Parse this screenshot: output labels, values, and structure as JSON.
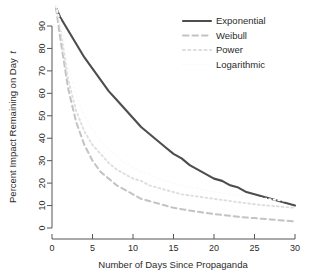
{
  "chart_data": {
    "type": "line",
    "title": "",
    "subtitle": "",
    "xlabel": "Number of Days Since Propaganda",
    "ylabel": "Percent Impact Remaining on Day t",
    "ylabel_italic_tail": "t",
    "xlim": [
      0,
      30
    ],
    "ylim": [
      0,
      100
    ],
    "xticks": [
      "0",
      "5",
      "10",
      "15",
      "20",
      "25",
      "30"
    ],
    "xtick_values": [
      0,
      5,
      10,
      15,
      20,
      25,
      30
    ],
    "yticks": [
      "0",
      "10",
      "20",
      "30",
      "40",
      "50",
      "60",
      "70",
      "80",
      "90"
    ],
    "ytick_values": [
      0,
      10,
      20,
      30,
      40,
      50,
      60,
      70,
      80,
      90
    ],
    "grid": false,
    "legend_position": "top-right",
    "x": [
      0.5,
      1,
      2,
      3,
      4,
      5,
      6,
      7,
      8,
      9,
      10,
      11,
      12,
      13,
      14,
      15,
      16,
      17,
      18,
      19,
      20,
      21,
      22,
      23,
      24,
      25,
      26,
      27,
      28,
      29,
      30
    ],
    "series": [
      {
        "name": "Exponential",
        "style": "solid",
        "color": "#4d4d4d",
        "width": 2.1,
        "values": [
          98,
          94,
          88,
          82,
          76,
          71,
          66,
          61,
          57,
          53,
          49,
          45,
          42,
          39,
          36,
          33,
          31,
          28,
          26,
          24,
          22,
          21,
          19,
          18,
          16,
          15,
          14,
          13,
          12,
          11,
          10
        ]
      },
      {
        "name": "Weibull",
        "style": "dashed",
        "color": "#c3c3c3",
        "width": 2.0,
        "values": [
          98,
          85,
          62,
          47,
          37,
          30,
          25,
          22,
          19,
          17,
          15,
          13,
          12,
          11,
          10,
          9,
          8.4,
          7.8,
          7.2,
          6.7,
          6.2,
          5.8,
          5.4,
          5.0,
          4.7,
          4.4,
          4.1,
          3.8,
          3.5,
          3.2,
          2.9
        ]
      },
      {
        "name": "Power",
        "style": "dotted",
        "color": "#dedede",
        "width": 1.9,
        "values": [
          99,
          90,
          66,
          52,
          43,
          37,
          33,
          29,
          26,
          24,
          22,
          21,
          19,
          18,
          17,
          16,
          15,
          14.5,
          14,
          13.5,
          13,
          12.5,
          12,
          11.5,
          11,
          10.6,
          10.2,
          9.9,
          9.6,
          9.3,
          9
        ]
      },
      {
        "name": "Logarithmic",
        "style": "dotted",
        "color": "#fbfbfb",
        "width": 1.8,
        "values": [
          99,
          92,
          72,
          59,
          50,
          44,
          39,
          35,
          32,
          29,
          27,
          25,
          24,
          22,
          21,
          20,
          19,
          18.2,
          17.5,
          16.8,
          16.2,
          15.6,
          15.0,
          14.5,
          14.0,
          13.6,
          13.2,
          12.8,
          12.4,
          12.1,
          11.8
        ]
      }
    ],
    "legend_entries": [
      {
        "label": "Exponential",
        "style": "solid",
        "color": "#4d4d4d"
      },
      {
        "label": "Weibull",
        "style": "dashed",
        "color": "#c3c3c3"
      },
      {
        "label": "Power",
        "style": "dotted",
        "color": "#dedede"
      },
      {
        "label": "Logarithmic",
        "style": "dotted",
        "color": "#fbfbfb"
      }
    ]
  }
}
